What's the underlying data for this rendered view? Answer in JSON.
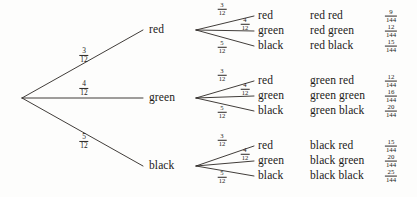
{
  "diagram": {
    "type": "probability-tree",
    "title": "",
    "root_label": "",
    "denominator_stage": "12",
    "denominator_outcome": "144",
    "stage1": [
      {
        "label": "red",
        "prob_num": "3",
        "prob_den": "12",
        "children": [
          {
            "label": "red",
            "prob_num": "3",
            "prob_den": "12",
            "outcome": "red red",
            "result_num": "9",
            "result_den": "144"
          },
          {
            "label": "green",
            "prob_num": "4",
            "prob_den": "12",
            "outcome": "red green",
            "result_num": "12",
            "result_den": "144"
          },
          {
            "label": "black",
            "prob_num": "5",
            "prob_den": "12",
            "outcome": "red black",
            "result_num": "15",
            "result_den": "144"
          }
        ]
      },
      {
        "label": "green",
        "prob_num": "4",
        "prob_den": "12",
        "children": [
          {
            "label": "red",
            "prob_num": "3",
            "prob_den": "12",
            "outcome": "green red",
            "result_num": "12",
            "result_den": "144"
          },
          {
            "label": "green",
            "prob_num": "4",
            "prob_den": "12",
            "outcome": "green green",
            "result_num": "16",
            "result_den": "144"
          },
          {
            "label": "black",
            "prob_num": "5",
            "prob_den": "12",
            "outcome": "green black",
            "result_num": "20",
            "result_den": "144"
          }
        ]
      },
      {
        "label": "black",
        "prob_num": "5",
        "prob_den": "12",
        "children": [
          {
            "label": "red",
            "prob_num": "3",
            "prob_den": "12",
            "outcome": "black red",
            "result_num": "15",
            "result_den": "144"
          },
          {
            "label": "green",
            "prob_num": "4",
            "prob_den": "12",
            "outcome": "black green",
            "result_num": "20",
            "result_den": "144"
          },
          {
            "label": "black",
            "prob_num": "5",
            "prob_den": "12",
            "outcome": "black black",
            "result_num": "25",
            "result_den": "144"
          }
        ]
      }
    ],
    "colors": {
      "ink": "#1c1a18",
      "line": "#2b2724",
      "paper": "#fdfdfc"
    }
  }
}
